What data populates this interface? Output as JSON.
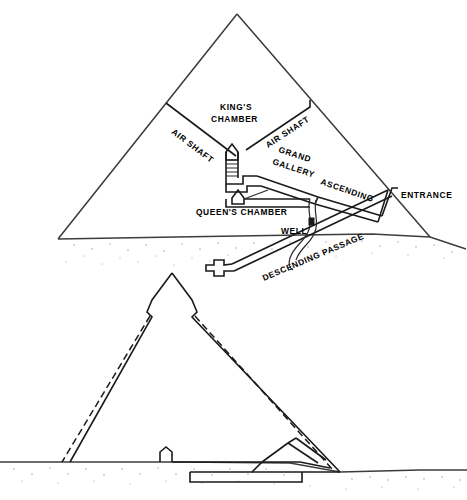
{
  "figure": {
    "upper_section_name": "Interior chambers and passages cross-section",
    "lower_section_name": "Casing and core profile cross-section"
  },
  "labels": {
    "air_shaft_left": "AIR SHAFT",
    "air_shaft_right": "AIR SHAFT",
    "kings_chamber_line1": "KING'S",
    "kings_chamber_line2": "CHAMBER",
    "grand_gallery_line1": "GRAND",
    "grand_gallery_line2": "GALLERY",
    "ascending": "ASCENDING",
    "queens_chamber": "QUEEN'S CHAMBER",
    "well": "WELL",
    "entrance": "ENTRANCE",
    "descending_passage": "DESCENDING PASSAGE"
  },
  "colors": {
    "ink": "#1a1a1a",
    "paper": "#ffffff",
    "ground": "#3d3d3d",
    "stipple": "#9a9a9a"
  }
}
